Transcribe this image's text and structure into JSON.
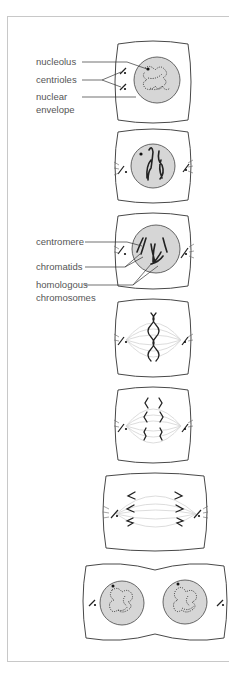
{
  "diagram": {
    "type": "mitosis-stages",
    "stages": [
      {
        "id": "interphase",
        "labels": [
          "nucleolus",
          "centrioles",
          "nuclear",
          "envelope"
        ]
      },
      {
        "id": "early-prophase",
        "labels": []
      },
      {
        "id": "late-prophase",
        "labels": [
          "centromere",
          "chromatids",
          "homologous",
          "chromosomes"
        ]
      },
      {
        "id": "metaphase",
        "labels": []
      },
      {
        "id": "early-anaphase",
        "labels": []
      },
      {
        "id": "late-anaphase",
        "labels": []
      },
      {
        "id": "telophase",
        "labels": []
      }
    ],
    "labels": {
      "nucleolus": "nucleolus",
      "centrioles": "centrioles",
      "nuclear_1": "nuclear",
      "nuclear_2": "envelope",
      "centromere": "centromere",
      "chromatids": "chromatids",
      "homologous_1": "homologous",
      "homologous_2": "chromosomes"
    },
    "colors": {
      "nucleus_fill": "#d6d6d6",
      "outline": "#333333",
      "spindle": "#d8d8d8",
      "label_text": "#555555",
      "frame": "#c8c8c8"
    }
  }
}
